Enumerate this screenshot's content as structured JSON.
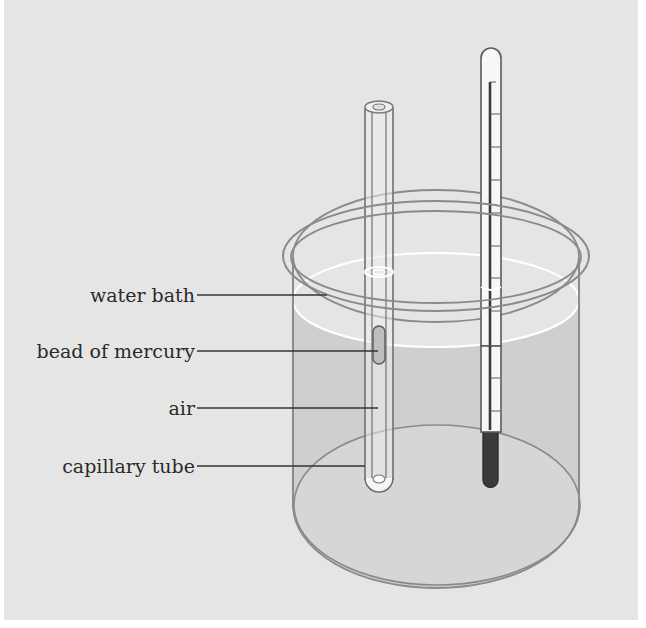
{
  "diagram": {
    "labels": [
      {
        "id": "water-bath",
        "text": "water bath"
      },
      {
        "id": "bead-of-mercury",
        "text": "bead of mercury"
      },
      {
        "id": "air",
        "text": "air"
      },
      {
        "id": "capillary-tube",
        "text": "capillary tube"
      }
    ],
    "components": [
      "beaker",
      "water bath",
      "capillary tube",
      "bead of mercury",
      "trapped air",
      "thermometer"
    ],
    "colors": {
      "background": "#e5e5e5",
      "water": "#cfcfcf",
      "outline": "#7a7a7a",
      "mercury": "#3a3a3a",
      "label_text": "#2a2a2a"
    }
  }
}
